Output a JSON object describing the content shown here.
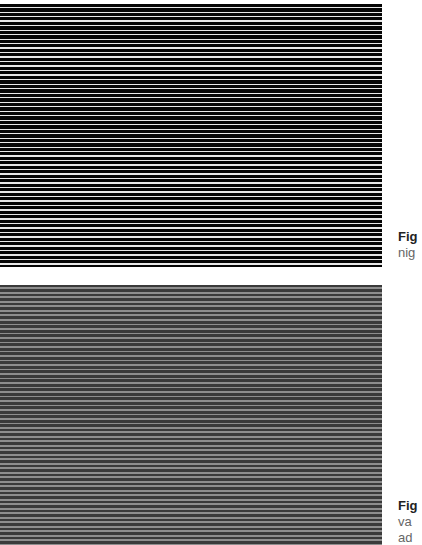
{
  "figures": [
    {
      "id": "top",
      "description": "black background with thin white horizontal stripes",
      "colors": {
        "dark": "#050505",
        "light": "#e8e8e8"
      },
      "caption": {
        "label": "Fig",
        "lines": [
          "nig"
        ]
      }
    },
    {
      "id": "bottom",
      "description": "gray horizontal stripes, lower contrast",
      "colors": {
        "dark": "#3a3a3a",
        "light": "#8e8e8e"
      },
      "caption": {
        "label": "Fig",
        "lines": [
          "va",
          "ad"
        ]
      }
    }
  ]
}
